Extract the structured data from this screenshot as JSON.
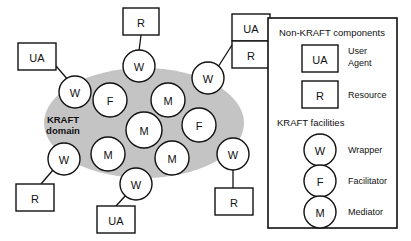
{
  "figure": {
    "domain_label_line1": "KRAFT",
    "domain_label_line2": "domain",
    "domain_fill": "#c4c4c4",
    "stroke_color": "#111111",
    "background": "#ffffff"
  },
  "inside_nodes": [
    {
      "id": "n-w-topleft",
      "label": "W",
      "cx": 62,
      "cy": 90
    },
    {
      "id": "n-f-upperleft",
      "label": "F",
      "cx": 109,
      "cy": 100
    },
    {
      "id": "n-m-upperright",
      "label": "M",
      "cx": 168,
      "cy": 100
    },
    {
      "id": "n-m-center",
      "label": "M",
      "cx": 143,
      "cy": 130
    },
    {
      "id": "n-f-right",
      "label": "F",
      "cx": 198,
      "cy": 125
    },
    {
      "id": "n-m-lowerleft",
      "label": "M",
      "cx": 108,
      "cy": 155
    },
    {
      "id": "n-m-lowerright",
      "label": "M",
      "cx": 172,
      "cy": 158
    }
  ],
  "edge_nodes": [
    {
      "id": "n-w-top",
      "label": "W",
      "cx": 137,
      "cy": 62
    },
    {
      "id": "n-w-topright",
      "label": "W",
      "cx": 209,
      "cy": 76
    },
    {
      "id": "n-w-left",
      "label": "W",
      "cx": 62,
      "cy": 90
    },
    {
      "id": "n-w-bottomleft",
      "label": "W",
      "cx": 60,
      "cy": 160
    },
    {
      "id": "n-w-bottom",
      "label": "W",
      "cx": 134,
      "cy": 185
    },
    {
      "id": "n-w-bottomright",
      "label": "W",
      "cx": 233,
      "cy": 157
    }
  ],
  "external_boxes": [
    {
      "id": "box-r-top",
      "label": "R",
      "x": 123,
      "y": 8,
      "w": 36,
      "h": 27
    },
    {
      "id": "box-ua-topright",
      "label": "UA",
      "x": 232,
      "y": 14,
      "w": 38,
      "h": 27
    },
    {
      "id": "box-r-topright",
      "label": "R",
      "x": 232,
      "y": 41,
      "w": 38,
      "h": 27
    },
    {
      "id": "box-ua-left",
      "label": "UA",
      "x": 18,
      "y": 43,
      "w": 38,
      "h": 27
    },
    {
      "id": "box-r-bottomleft",
      "label": "R",
      "x": 16,
      "y": 184,
      "w": 38,
      "h": 27
    },
    {
      "id": "box-ua-bottom",
      "label": "UA",
      "x": 97,
      "y": 206,
      "w": 38,
      "h": 27
    },
    {
      "id": "box-r-bottomright",
      "label": "R",
      "x": 215,
      "y": 188,
      "w": 38,
      "h": 27
    }
  ],
  "connectors": [
    {
      "id": "link-r-top-to-w",
      "x1": 141,
      "y1": 35,
      "x2": 139,
      "y2": 51
    },
    {
      "id": "link-uar-topright-to-w",
      "x1": 232,
      "y1": 45,
      "x2": 217,
      "y2": 67
    },
    {
      "id": "link-ua-left-to-w",
      "x1": 56,
      "y1": 65,
      "x2": 69,
      "y2": 80
    },
    {
      "id": "link-w-to-r-bottomleft",
      "x1": 53,
      "y1": 170,
      "x2": 40,
      "y2": 184
    },
    {
      "id": "link-w-to-ua-bottom",
      "x1": 127,
      "y1": 194,
      "x2": 115,
      "y2": 206
    },
    {
      "id": "link-w-to-r-bottomright",
      "x1": 233,
      "y1": 168,
      "x2": 233,
      "y2": 188
    }
  ],
  "legend": {
    "frame": {
      "x": 268,
      "y": 18,
      "w": 129,
      "h": 210
    },
    "section1_title": "Non-KRAFT components",
    "section2_title": "KRAFT facilities",
    "box_items": [
      {
        "id": "legend-ua",
        "glyph": "UA",
        "desc_line1": "User",
        "desc_line2": "Agent"
      },
      {
        "id": "legend-r",
        "glyph": "R",
        "desc_line1": "Resource",
        "desc_line2": ""
      }
    ],
    "circle_items": [
      {
        "id": "legend-w",
        "glyph": "W",
        "desc": "Wrapper"
      },
      {
        "id": "legend-f",
        "glyph": "F",
        "desc": "Facilitator"
      },
      {
        "id": "legend-m",
        "glyph": "M",
        "desc": "Mediator"
      }
    ]
  }
}
